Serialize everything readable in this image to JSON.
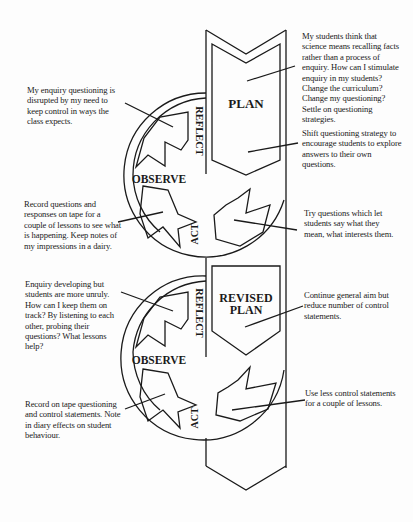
{
  "colors": {
    "ink": "#1a1a1a",
    "paper": "#fdfdfd"
  },
  "cycle1": {
    "stages": {
      "plan": "PLAN",
      "reflect": "REFLECT",
      "observe": "OBSERVE",
      "act": "ACT"
    },
    "notes": {
      "plan_top": "My students think that science means recalling facts rather than a process of enquiry. How can I stimulate enquiry in my students? Change the curriculum? Change my questioning? Settle on questioning strategies.",
      "plan_bottom": "Shift questioning strategy to encourage students to explore answers to their own questions.",
      "reflect": "My enquiry questioning is disrupted by my need to keep control in ways the class expects.",
      "observe": "Record questions and responses on tape for a couple of lessons to see what is happening. Keep notes of my impressions in a dairy.",
      "act": "Try questions which let students say what they mean, what interests them."
    }
  },
  "cycle2": {
    "stages": {
      "plan_line1": "REVISED",
      "plan_line2": "PLAN",
      "reflect": "REFLECT",
      "observe": "OBSERVE",
      "act": "ACT"
    },
    "notes": {
      "plan": "Continue general aim but reduce number of control statements.",
      "reflect": "Enquiry developing but students are more unruly. How can I keep them on track? By listening to each other, probing their questions? What lessons help?",
      "observe": "Record on tape questioning and control statements. Note in diary effects on student behaviour.",
      "act": "Use less control statements for a couple of lessons."
    }
  }
}
